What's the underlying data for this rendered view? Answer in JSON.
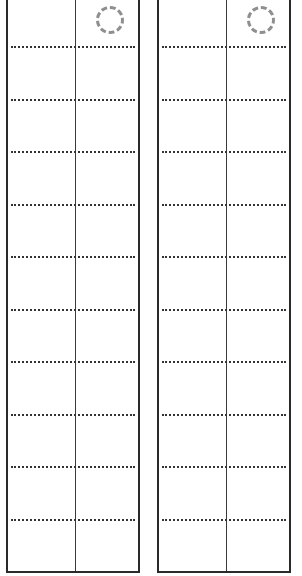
{
  "sheet": {
    "panels": [
      {
        "id": "left",
        "rows": 11,
        "columns": 2,
        "marker": "dashed-circle"
      },
      {
        "id": "right",
        "rows": 11,
        "columns": 2,
        "marker": "dashed-circle"
      }
    ],
    "row_rule_offsets_px": [
      48,
      101,
      153,
      206,
      258,
      311,
      363,
      416,
      468,
      521
    ],
    "colors": {
      "border": "#2a2a2a",
      "divider": "#3a3a3a",
      "dotted_rule": "#333333",
      "marker": "#8f8f8f",
      "background": "#ffffff"
    }
  }
}
